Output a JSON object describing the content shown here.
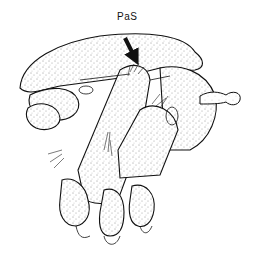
{
  "figure": {
    "type": "stippled anatomical illustration",
    "background": "#ffffff",
    "ink_color": "#111111"
  },
  "labels": [
    {
      "id": "pas",
      "text": "PaS",
      "x": 117,
      "y": 11
    }
  ],
  "annotations": {
    "arrow": {
      "from": [
        125,
        38
      ],
      "to": [
        137,
        63
      ],
      "color": "#111111",
      "points_to": "PaS"
    }
  }
}
